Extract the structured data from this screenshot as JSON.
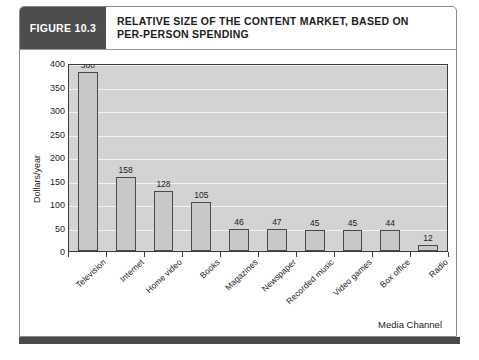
{
  "figure": {
    "badge": "FIGURE 10.3",
    "title_line1": "RELATIVE SIZE OF THE CONTENT MARKET, BASED ON",
    "title_line2": "PER-PERSON SPENDING"
  },
  "colors": {
    "badge_bg": "#4d4d4d",
    "plot_bg": "#d3d3d3",
    "gridline": "#f2f2f2",
    "bar_fill": "#c8c8c8",
    "bar_border": "#4a4a4a",
    "axis": "#3a3a3a",
    "text": "#1c1c1c",
    "bottom_band": "#4a4a4a"
  },
  "chart_data": {
    "type": "bar",
    "title": "RELATIVE SIZE OF THE CONTENT MARKET, BASED ON PER-PERSON SPENDING",
    "xlabel": "Media Channel",
    "ylabel": "Dollars/year",
    "categories": [
      "Television",
      "Internet",
      "Home video",
      "Books",
      "Magazines",
      "Newspaper",
      "Recorded music",
      "Video games",
      "Box office",
      "Radio"
    ],
    "values": [
      380,
      158,
      128,
      105,
      46,
      47,
      45,
      45,
      44,
      12
    ],
    "data_labels": [
      "380",
      "158",
      "128",
      "105",
      "46",
      "47",
      "45",
      "45",
      "44",
      "12"
    ],
    "ylim": [
      0,
      400
    ],
    "yticks": [
      0,
      50,
      100,
      150,
      200,
      250,
      300,
      350,
      400
    ],
    "ytick_labels": [
      "0",
      "50",
      "100",
      "150",
      "200",
      "250",
      "300",
      "350",
      "400"
    ],
    "grid": true,
    "legend": false,
    "legend_position": "none"
  }
}
